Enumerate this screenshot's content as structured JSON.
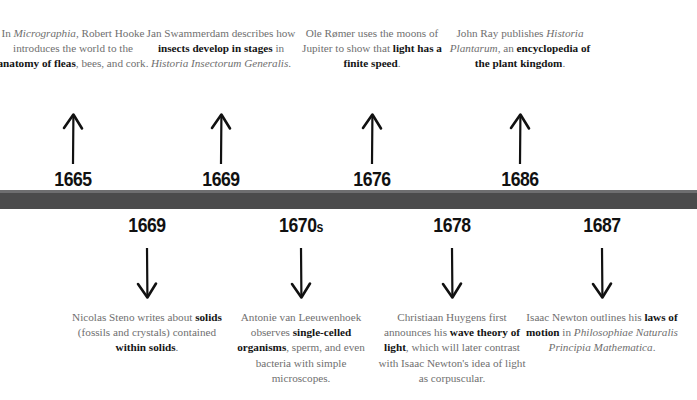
{
  "meta": {
    "bar_color": "#4b4b4c",
    "bar_highlight_color": "#6e6e70",
    "body_text_color": "#6f6f6f",
    "emphasis_text_color": "#141414",
    "background_color": "#ffffff"
  },
  "events_above": [
    {
      "year": "1665",
      "year_suffix": "",
      "x": 73,
      "arrow": "arrow-up-icon",
      "caption_html": "In <i>Micrographia</i>, Robert Hooke introduces the world to the <b>anatomy of fleas</b>, bees, and cork.",
      "caption_plain": "In Micrographia, Robert Hooke introduces the world to the anatomy of fleas, bees, and cork."
    },
    {
      "year": "1669",
      "year_suffix": "",
      "x": 221,
      "arrow": "arrow-up-icon",
      "caption_html": "Jan Swammerdam describes how <b>insects develop in stages</b> in <i>Historia Insectorum Generalis</i>.",
      "caption_plain": "Jan Swammerdam describes how insects develop in stages in Historia Insectorum Generalis."
    },
    {
      "year": "1676",
      "year_suffix": "",
      "x": 372,
      "arrow": "arrow-up-icon",
      "caption_html": "Ole Rømer uses the moons of Jupiter to show that <b>light has a finite speed</b>.",
      "caption_plain": "Ole Rømer uses the moons of Jupiter to show that light has a finite speed."
    },
    {
      "year": "1686",
      "year_suffix": "",
      "x": 520,
      "arrow": "arrow-up-icon",
      "caption_html": "John Ray publishes <i>Historia Plantarum</i>, an <b>encyclopedia of the plant kingdom</b>.",
      "caption_plain": "John Ray publishes Historia Plantarum, an encyclopedia of the plant kingdom."
    }
  ],
  "events_below": [
    {
      "year": "1669",
      "year_suffix": "",
      "x": 147,
      "arrow": "arrow-down-icon",
      "caption_html": "Nicolas Steno writes about <b>solids</b> (fossils and crystals) contained <b>within solids</b>.",
      "caption_plain": "Nicolas Steno writes about solids (fossils and crystals) contained within solids."
    },
    {
      "year": "1670",
      "year_suffix": "s",
      "x": 301,
      "arrow": "arrow-down-icon",
      "caption_html": "Antonie van Leeuwenhoek observes <b>single-celled organisms</b>, sperm, and even bacteria with simple microscopes.",
      "caption_plain": "Antonie van Leeuwenhoek observes single-celled organisms, sperm, and even bacteria with simple microscopes."
    },
    {
      "year": "1678",
      "year_suffix": "",
      "x": 452,
      "arrow": "arrow-down-icon",
      "caption_html": "Christiaan Huygens first announces his <b>wave theory of light</b>, which will later contrast with Isaac Newton's idea of light as corpuscular.",
      "caption_plain": "Christiaan Huygens first announces his wave theory of light, which will later contrast with Isaac Newton's idea of light as corpuscular."
    },
    {
      "year": "1687",
      "year_suffix": "",
      "x": 602,
      "arrow": "arrow-down-icon",
      "caption_html": "Isaac Newton outlines his <b>laws of motion</b> in <i>Philosophiae Naturalis Principia Mathematica</i>.",
      "caption_plain": "Isaac Newton outlines his laws of motion in Philosophiae Naturalis Principia Mathematica."
    }
  ]
}
